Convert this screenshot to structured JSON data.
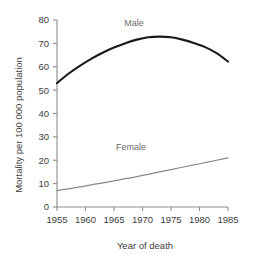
{
  "chart_data": {
    "type": "line",
    "title": "",
    "subtitle": "",
    "xlabel": "Year of death",
    "ylabel": "Mortality per 100 000 population",
    "xlim": [
      1955,
      1985
    ],
    "ylim": [
      0,
      80
    ],
    "grid": false,
    "legend_position": "inline-annotation",
    "x_ticks": [
      1955,
      1960,
      1965,
      1970,
      1975,
      1980,
      1985
    ],
    "x_tick_labels": [
      "1955",
      "1960",
      "1965",
      "1970",
      "1975",
      "1980",
      "1985"
    ],
    "y_ticks": [
      0,
      10,
      20,
      30,
      40,
      50,
      60,
      70,
      80
    ],
    "y_tick_labels": [
      "0",
      "10",
      "20",
      "30",
      "40",
      "50",
      "60",
      "70",
      "80"
    ],
    "x": [
      1955,
      1957,
      1959,
      1961,
      1963,
      1965,
      1967,
      1969,
      1971,
      1973,
      1975,
      1977,
      1979,
      1981,
      1983,
      1985
    ],
    "series": [
      {
        "name": "Male",
        "label": "Male",
        "color": "#1a1a1a",
        "stroke_width": 2.1,
        "label_x": 1968.5,
        "label_y": 77.5,
        "values": [
          53.0,
          57.0,
          60.4,
          63.4,
          66.0,
          68.2,
          70.1,
          71.6,
          72.6,
          72.9,
          72.6,
          71.6,
          70.2,
          68.4,
          65.8,
          62.2
        ]
      },
      {
        "name": "Female",
        "label": "Female",
        "color": "#8a8a8a",
        "stroke_width": 1.25,
        "label_x": 1968.0,
        "label_y": 24.5,
        "values": [
          7.0,
          7.8,
          8.6,
          9.5,
          10.3,
          11.2,
          12.1,
          13.0,
          14.0,
          15.0,
          16.0,
          17.0,
          18.0,
          19.0,
          20.0,
          21.0
        ]
      }
    ]
  }
}
